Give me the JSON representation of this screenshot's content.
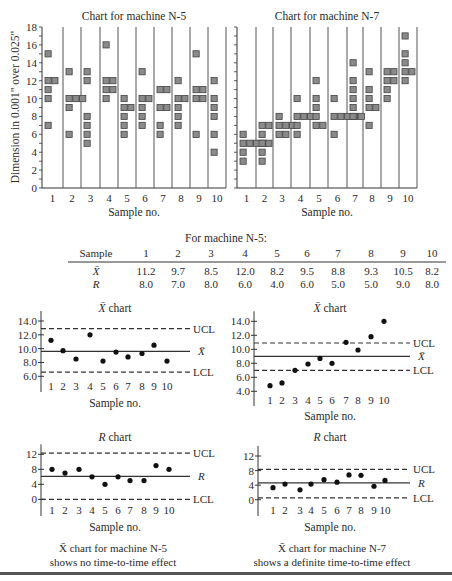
{
  "figure": {
    "y_axis_label": "Dimension in 0.001\" over 0.025\"",
    "x_axis_label": "Sample no.",
    "table_title": "For machine N-5:",
    "table": {
      "header_label": "Sample",
      "columns": [
        "1",
        "2",
        "3",
        "4",
        "5",
        "6",
        "7",
        "8",
        "9",
        "10"
      ],
      "rows": [
        {
          "label": "X̄",
          "values": [
            "11.2",
            "9.7",
            "8.5",
            "12.0",
            "8.2",
            "9.5",
            "8.8",
            "9.3",
            "10.5",
            "8.2"
          ]
        },
        {
          "label": "R",
          "values": [
            "8.0",
            "7.0",
            "8.0",
            "6.0",
            "4.0",
            "6.0",
            "5.0",
            "5.0",
            "9.0",
            "8.0"
          ]
        }
      ]
    },
    "captions": {
      "n5_line1": "X̄ chart for machine N-5",
      "n5_line2": "shows no time-to-time effect",
      "n7_line1": "X̄ chart for machine N-7",
      "n7_line2": "shows a definite time-to-time effect"
    },
    "colors": {
      "marker_fill": "#8a8a8a",
      "marker_border": "#444444",
      "line": "#333333",
      "dot": "#111111"
    }
  },
  "chart_data": [
    {
      "id": "scatter_n5",
      "type": "scatter",
      "title": "Chart for machine N-5",
      "xlabel": "Sample no.",
      "ylabel": "Dimension in 0.001\" over 0.025\"",
      "ylim": [
        0,
        18
      ],
      "yticks": [
        0,
        2,
        4,
        6,
        8,
        10,
        12,
        14,
        16,
        18
      ],
      "categories": [
        "1",
        "2",
        "3",
        "4",
        "5",
        "6",
        "7",
        "8",
        "9",
        "10"
      ],
      "samples": [
        [
          15,
          12,
          12,
          11,
          10,
          7
        ],
        [
          13,
          10,
          10,
          10,
          9,
          6
        ],
        [
          13,
          12,
          8,
          7,
          6,
          5
        ],
        [
          16,
          12,
          12,
          11,
          11,
          10
        ],
        [
          10,
          9,
          9,
          8,
          7,
          6
        ],
        [
          13,
          10,
          10,
          9,
          8,
          7
        ],
        [
          11,
          11,
          9,
          9,
          7,
          6
        ],
        [
          12,
          10,
          10,
          9,
          8,
          7
        ],
        [
          15,
          11,
          11,
          10,
          10,
          6
        ],
        [
          12,
          10,
          9,
          8,
          6,
          4
        ]
      ]
    },
    {
      "id": "scatter_n7",
      "type": "scatter",
      "title": "Chart for machine N-7",
      "xlabel": "Sample no.",
      "ylim": [
        0,
        18
      ],
      "categories": [
        "1",
        "2",
        "3",
        "4",
        "5",
        "6",
        "7",
        "8",
        "9",
        "10"
      ],
      "samples": [
        [
          6,
          5,
          5,
          5,
          5,
          4,
          3
        ],
        [
          7,
          7,
          6,
          5,
          5,
          4,
          3
        ],
        [
          8,
          7,
          7,
          7,
          6,
          6
        ],
        [
          10,
          8,
          8,
          8,
          7,
          6
        ],
        [
          12,
          10,
          9,
          8,
          7,
          7
        ],
        [
          10,
          8,
          8,
          8,
          8,
          8,
          6
        ],
        [
          14,
          12,
          11,
          10,
          9,
          8
        ],
        [
          13,
          11,
          10,
          9,
          9,
          7
        ],
        [
          13,
          13,
          12,
          12,
          11,
          10
        ],
        [
          17,
          15,
          14,
          13,
          13,
          12
        ]
      ]
    },
    {
      "id": "xbar_n5",
      "type": "line",
      "title": "X̄ chart",
      "xlabel": "Sample no.",
      "ylim": [
        6.0,
        14.0
      ],
      "yticks": [
        "6.0",
        "8.0",
        "10.0",
        "12.0",
        "14.0"
      ],
      "categories": [
        "1",
        "2",
        "3",
        "4",
        "5",
        "6",
        "7",
        "8",
        "9",
        "10"
      ],
      "values": [
        11.2,
        9.7,
        8.5,
        12.0,
        8.2,
        9.5,
        8.8,
        9.3,
        10.5,
        8.2
      ],
      "ucl": 12.9,
      "center": 9.6,
      "lcl": 6.6,
      "labels": {
        "ucl": "UCL",
        "center": "X̄",
        "lcl": "LCL"
      }
    },
    {
      "id": "xbar_n7",
      "type": "line",
      "title": "X̄ chart",
      "xlabel": "Sample no.",
      "ylim": [
        4.0,
        14.0
      ],
      "yticks": [
        "4.0",
        "6.0",
        "8.0",
        "10.0",
        "12.0",
        "14.0"
      ],
      "categories": [
        "1",
        "2",
        "3",
        "4",
        "5",
        "6",
        "7",
        "8",
        "9",
        "10"
      ],
      "values": [
        4.8,
        5.2,
        7.0,
        7.9,
        8.7,
        8.0,
        11.0,
        9.9,
        11.8,
        14.0
      ],
      "ucl": 10.9,
      "center": 9.0,
      "lcl": 7.0,
      "labels": {
        "ucl": "UCL",
        "center": "X̄",
        "lcl": "LCL"
      }
    },
    {
      "id": "r_n5",
      "type": "line",
      "title": "R chart",
      "xlabel": "Sample no.",
      "ylim": [
        0,
        12
      ],
      "yticks": [
        "0",
        "4",
        "8",
        "12"
      ],
      "categories": [
        "1",
        "2",
        "3",
        "4",
        "5",
        "6",
        "7",
        "8",
        "9",
        "10"
      ],
      "values": [
        8.0,
        7.0,
        8.0,
        6.0,
        4.0,
        6.0,
        5.0,
        5.0,
        9.0,
        8.0
      ],
      "ucl": 12.3,
      "center": 6.1,
      "lcl": 0,
      "labels": {
        "ucl": "UCL",
        "center": "R",
        "lcl": "LCL"
      }
    },
    {
      "id": "r_n7",
      "type": "line",
      "title": "R chart",
      "xlabel": "Sample no.",
      "ylim": [
        0,
        12
      ],
      "yticks": [
        "0",
        "4",
        "8",
        "12"
      ],
      "categories": [
        "1",
        "2",
        "3",
        "4",
        "5",
        "6",
        "7",
        "8",
        "9",
        "10"
      ],
      "values": [
        3.3,
        4.3,
        2.7,
        4.3,
        5.5,
        4.8,
        6.8,
        6.7,
        3.7,
        5.3
      ],
      "ucl": 8.3,
      "center": 4.6,
      "lcl": 0.5,
      "labels": {
        "ucl": "UCL",
        "center": "R",
        "lcl": "LCL"
      }
    }
  ]
}
